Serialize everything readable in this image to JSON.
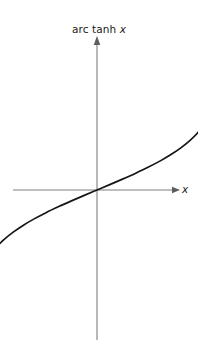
{
  "chart_data": {
    "type": "line",
    "title": "arc tanh x",
    "title_prefix": "arc tanh ",
    "title_variable": "x",
    "xlabel": "x",
    "ylabel": "arc tanh x",
    "grid": false,
    "legend": false,
    "xlim": [
      -1.35,
      1.35
    ],
    "ylim": [
      -2.75,
      2.75
    ],
    "function": "arctanh",
    "asymptotes": {
      "type": "vertical-dashed",
      "values": [
        -1,
        1
      ],
      "color": "#b9b9b9"
    },
    "axes": {
      "x_axis_arrow": true,
      "y_axis_arrow": true,
      "color": "#808080"
    },
    "curve": {
      "name": "arc tanh x",
      "color": "#161616",
      "width": 1.6,
      "x": [
        -0.985,
        -0.97,
        -0.95,
        -0.92,
        -0.88,
        -0.84,
        -0.79,
        -0.73,
        -0.66,
        -0.58,
        -0.5,
        -0.4,
        -0.3,
        -0.2,
        -0.1,
        0,
        0.1,
        0.2,
        0.3,
        0.4,
        0.5,
        0.58,
        0.66,
        0.73,
        0.79,
        0.84,
        0.88,
        0.92,
        0.95,
        0.97,
        0.985
      ],
      "y": [
        -2.474,
        -2.092,
        -1.832,
        -1.589,
        -1.376,
        -1.221,
        -1.071,
        -0.929,
        -0.793,
        -0.662,
        -0.549,
        -0.424,
        -0.31,
        -0.203,
        -0.1,
        0,
        0.1,
        0.203,
        0.31,
        0.424,
        0.549,
        0.662,
        0.793,
        0.929,
        1.071,
        1.221,
        1.376,
        1.589,
        1.832,
        2.092,
        2.474
      ]
    },
    "annotations": []
  },
  "labels": {
    "chart_title_prefix": "arc tanh ",
    "chart_title_variable": "x",
    "x_axis_label": "x"
  }
}
